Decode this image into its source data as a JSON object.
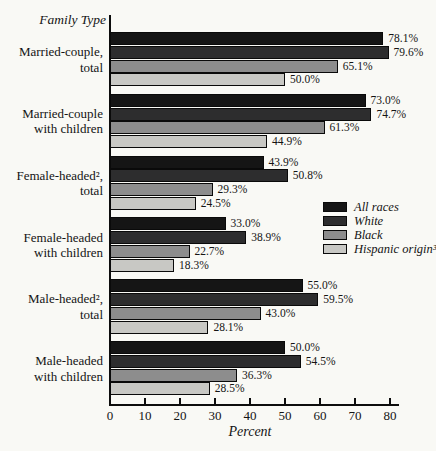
{
  "figure": {
    "title": "Family Type",
    "xlabel": "Percent"
  },
  "chart_data": {
    "type": "bar",
    "orientation": "horizontal",
    "title": "Family Type",
    "xlabel": "Percent",
    "xlim": [
      0,
      80
    ],
    "xticks": [
      0,
      10,
      20,
      30,
      40,
      50,
      60,
      70,
      80
    ],
    "grid": false,
    "legend_position": "right-middle",
    "value_labels": true,
    "value_label_format": "{value}%",
    "categories": [
      {
        "lines": [
          "Married-couple,",
          "total"
        ]
      },
      {
        "lines": [
          "Married-couple",
          "with children"
        ]
      },
      {
        "lines": [
          "Female-headed²,",
          "total"
        ]
      },
      {
        "lines": [
          "Female-headed",
          "with children"
        ]
      },
      {
        "lines": [
          "Male-headed²,",
          "total"
        ]
      },
      {
        "lines": [
          "Male-headed",
          "with children"
        ]
      }
    ],
    "series": [
      {
        "name": "All races",
        "color": "#151515",
        "values": [
          78.1,
          73.0,
          43.9,
          33.0,
          55.0,
          50.0
        ]
      },
      {
        "name": "White",
        "color": "#2d2d2e",
        "values": [
          79.6,
          74.7,
          50.8,
          38.9,
          59.5,
          54.5
        ]
      },
      {
        "name": "Black",
        "color": "#8d8d8d",
        "values": [
          65.1,
          61.3,
          29.3,
          22.7,
          43.0,
          36.3
        ]
      },
      {
        "name": "Hispanic origin³",
        "color": "#c8c8c4",
        "values": [
          50.0,
          44.9,
          24.5,
          18.3,
          28.1,
          28.5
        ]
      }
    ]
  },
  "colors": {
    "background": "#f9f9f5",
    "axis": "#0d0d0d",
    "text": "#141414"
  }
}
